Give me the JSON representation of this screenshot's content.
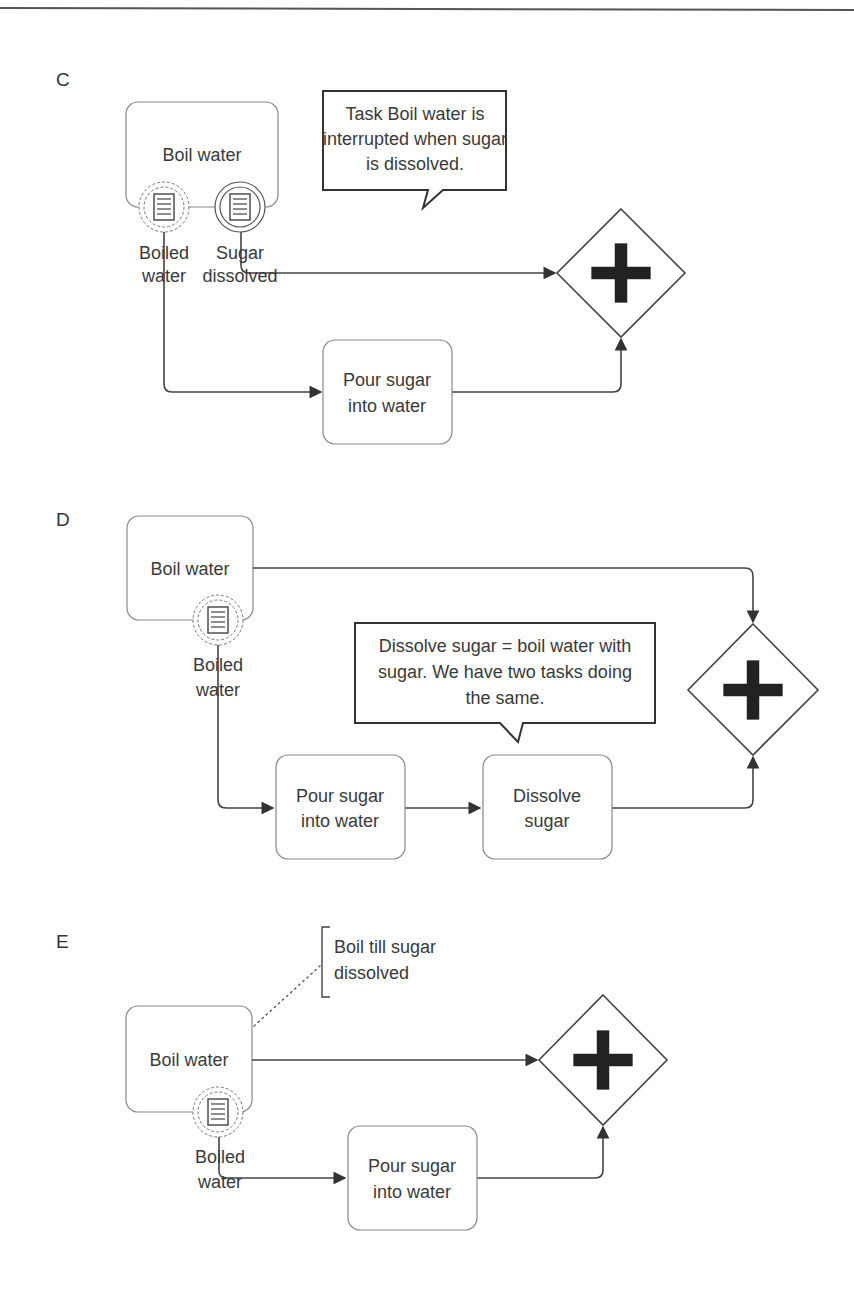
{
  "sections": {
    "c": {
      "letter": "C",
      "tasks": {
        "boil_water": "Boil water",
        "pour_sugar_line1": "Pour sugar",
        "pour_sugar_line2": "into water"
      },
      "events": {
        "boiled_water_line1": "Boiled",
        "boiled_water_line2": "water",
        "sugar_dissolved_line1": "Sugar",
        "sugar_dissolved_line2": "dissolved"
      },
      "callout": {
        "line1": "Task Boil water is",
        "line2": "interrupted when sugar",
        "line3": "is dissolved."
      },
      "gateway": "parallel-gateway"
    },
    "d": {
      "letter": "D",
      "tasks": {
        "boil_water": "Boil water",
        "pour_sugar_line1": "Pour sugar",
        "pour_sugar_line2": "into water",
        "dissolve_sugar_line1": "Dissolve",
        "dissolve_sugar_line2": "sugar"
      },
      "events": {
        "boiled_water_line1": "Boiled",
        "boiled_water_line2": "water"
      },
      "callout": {
        "line1": "Dissolve sugar = boil water with",
        "line2": "sugar. We have two tasks doing",
        "line3": "the same."
      },
      "gateway": "parallel-gateway"
    },
    "e": {
      "letter": "E",
      "tasks": {
        "boil_water": "Boil water",
        "pour_sugar_line1": "Pour sugar",
        "pour_sugar_line2": "into water"
      },
      "events": {
        "boiled_water_line1": "Boiled",
        "boiled_water_line2": "water"
      },
      "annotation": {
        "line1": "Boil till sugar",
        "line2": "dissolved"
      },
      "gateway": "parallel-gateway"
    }
  }
}
